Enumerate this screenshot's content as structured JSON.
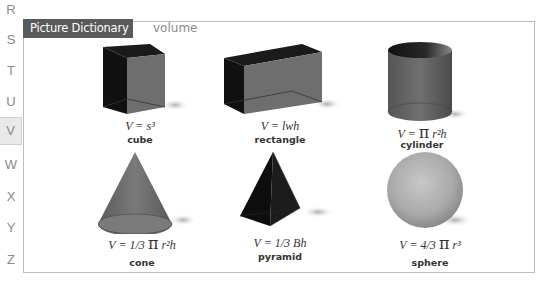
{
  "alphabet_nav": {
    "letters": [
      "R",
      "S",
      "T",
      "U",
      "V",
      "W",
      "X",
      "Y",
      "Z"
    ],
    "active": "V"
  },
  "header": {
    "title": "Picture Dictionary",
    "word": "volume"
  },
  "shapes": [
    {
      "name": "cube",
      "formula": "V = s³"
    },
    {
      "name": "rectangle",
      "formula": "V = lwh"
    },
    {
      "name": "cylinder",
      "formula_pre": "V = ",
      "pi": "π",
      "formula_post": " r²h"
    },
    {
      "name": "cone",
      "formula_pre": "V = 1/3 ",
      "pi": "π",
      "formula_post": " r²h"
    },
    {
      "name": "pyramid",
      "formula": "V = 1/3 Bh"
    },
    {
      "name": "sphere",
      "formula_pre": "V = 4/3 ",
      "pi": "π",
      "formula_post": " r³"
    }
  ],
  "colors": {
    "title_bg": "#5a5a5a",
    "active_letter_bg": "#e9e9e9",
    "frame_border": "#bdbdbd"
  }
}
